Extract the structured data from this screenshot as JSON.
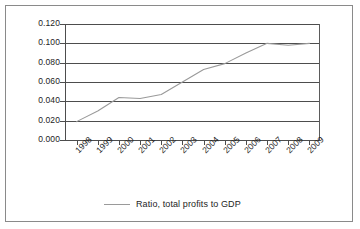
{
  "chart_data": {
    "type": "line",
    "title": "",
    "xlabel": "",
    "ylabel": "",
    "grid": "horizontal",
    "legend_position": "bottom",
    "categories": [
      "1998",
      "1999",
      "2000",
      "2001",
      "2002",
      "2003",
      "2004",
      "2005",
      "2006",
      "2007",
      "2008",
      "2009"
    ],
    "ylim": [
      0.0,
      0.12
    ],
    "ytick_labels": [
      "0.120",
      "0.100",
      "0.080",
      "0.060",
      "0.040",
      "0.020",
      "0.000"
    ],
    "ytick_values": [
      0.12,
      0.1,
      0.08,
      0.06,
      0.04,
      0.02,
      0.0
    ],
    "series": [
      {
        "name": "Ratio, total profits to GDP",
        "color": "#9a9a9a",
        "values": [
          0.019,
          0.03,
          0.044,
          0.043,
          0.047,
          0.06,
          0.073,
          0.079,
          0.09,
          0.1,
          0.098,
          0.1
        ]
      }
    ]
  },
  "legend": {
    "entries": [
      {
        "label": "Ratio, total profits to GDP",
        "swatch": "line-swatch"
      }
    ]
  }
}
